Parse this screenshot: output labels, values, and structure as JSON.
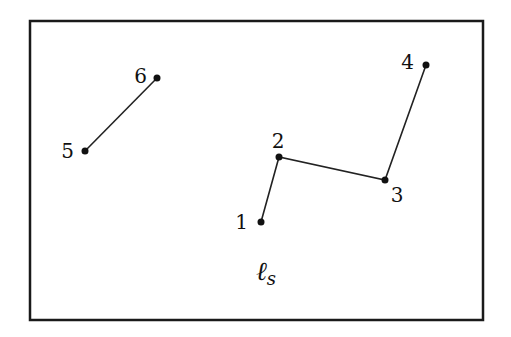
{
  "diagram": {
    "frame": {
      "x": 30,
      "y": 21,
      "width": 453,
      "height": 299,
      "stroke": "#1a1a1a",
      "stroke_width": 2.5
    },
    "line_color": "#222222",
    "point_color": "#111111",
    "points": [
      {
        "id": "1",
        "label": "1",
        "x": 261,
        "y": 222,
        "lx": 248,
        "ly": 229,
        "anchor": "end"
      },
      {
        "id": "2",
        "label": "2",
        "x": 279,
        "y": 157,
        "lx": 278,
        "ly": 148,
        "anchor": "middle"
      },
      {
        "id": "3",
        "label": "3",
        "x": 385,
        "y": 180,
        "lx": 397,
        "ly": 202,
        "anchor": "middle"
      },
      {
        "id": "4",
        "label": "4",
        "x": 426,
        "y": 65,
        "lx": 414,
        "ly": 69,
        "anchor": "end"
      },
      {
        "id": "5",
        "label": "5",
        "x": 85,
        "y": 151,
        "lx": 74,
        "ly": 158,
        "anchor": "end"
      },
      {
        "id": "6",
        "label": "6",
        "x": 157,
        "y": 78,
        "lx": 147,
        "ly": 83,
        "anchor": "end"
      }
    ],
    "polylines": [
      {
        "name": "chain-1-2-3-4",
        "points": [
          "1",
          "2",
          "3",
          "4"
        ]
      },
      {
        "name": "segment-5-6",
        "points": [
          "5",
          "6"
        ]
      }
    ],
    "caption": {
      "main": "ℓ",
      "sub": "s",
      "x": 256,
      "y": 280
    }
  }
}
